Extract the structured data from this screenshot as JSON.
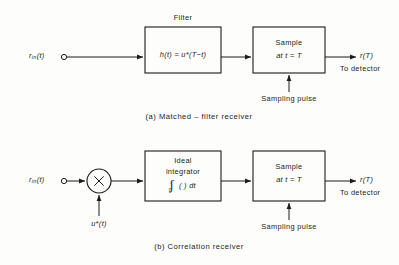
{
  "figure": {
    "background_color": "#fdfdfc",
    "ink_color": "#1b1b1b"
  },
  "diagrams": [
    {
      "id": "matched-filter-receiver",
      "caption": "(a)  Matched – filter receiver",
      "input_label": {
        "base": "r",
        "sub": "in",
        "arg": "(t)"
      },
      "blocks": [
        {
          "id": "filter",
          "top_label": "Filter",
          "line1_html": "h(t) = u*(T−t)"
        },
        {
          "id": "sampler",
          "line1": "Sample",
          "line2": "at t = T"
        }
      ],
      "sampling_pulse_label": "Sampling pulse",
      "output_label": "r(T)",
      "output_note": "To detector"
    },
    {
      "id": "correlation-receiver",
      "caption": "(b)  Correlation receiver",
      "input_label": {
        "base": "r",
        "sub": "in",
        "arg": "(t)"
      },
      "multiplier_glyph": "✕",
      "multiplier_input_label": "u*(t)",
      "blocks": [
        {
          "id": "integrator",
          "line1": "Ideal",
          "line2": "integrator",
          "integral_upper": "t",
          "integral_lower": "0",
          "integral_body": "(   ) dt"
        },
        {
          "id": "sampler",
          "line1": "Sample",
          "line2": "at t = T"
        }
      ],
      "sampling_pulse_label": "Sampling pulse",
      "output_label": "r(T)",
      "output_note": "To detector"
    }
  ]
}
